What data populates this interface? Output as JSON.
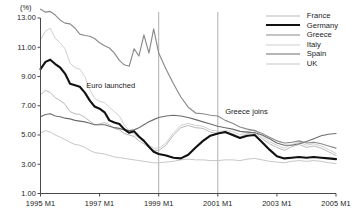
{
  "chart_data": {
    "type": "line",
    "title": "",
    "xlabel": "",
    "ylabel": "(%)",
    "unit_label": "(%)",
    "ylim": [
      1.0,
      13.0
    ],
    "ytick_values": [
      1.0,
      3.0,
      5.0,
      7.0,
      9.0,
      11.0,
      13.0
    ],
    "ytick_labels": [
      "1.00",
      "3.00",
      "5.00",
      "7.00",
      "9.00",
      "11.00",
      "13.00"
    ],
    "xtick_labels": [
      "1995 M1",
      "1997 M1",
      "1999 M1",
      "2001 M1",
      "2003 M1",
      "2005 M1"
    ],
    "xtick_values": [
      1995.0,
      1997.0,
      1999.0,
      2001.0,
      2003.0,
      2005.0
    ],
    "xlim": [
      1995.0,
      2005.0
    ],
    "grid": false,
    "legend_position": "top-right",
    "annotations": [
      {
        "label": "Euro launched",
        "x": 1999.0,
        "text_x": 1996.55,
        "text_y": 8.35
      },
      {
        "label": "Greece joins",
        "x": 2001.0,
        "text_x": 2001.25,
        "text_y": 6.55
      }
    ],
    "series": [
      {
        "name": "France",
        "color": "#b9b9b9",
        "width": 1.0,
        "x": [
          1995.0,
          1995.17,
          1995.33,
          1995.5,
          1995.67,
          1995.83,
          1996.0,
          1996.17,
          1996.33,
          1996.5,
          1996.67,
          1996.83,
          1997.0,
          1997.17,
          1997.33,
          1997.5,
          1997.67,
          1997.83,
          1998.0,
          1998.17,
          1998.33,
          1998.5,
          1998.67,
          1998.83,
          1999.0,
          1999.25,
          1999.5,
          1999.75,
          2000.0,
          2000.25,
          2000.5,
          2000.75,
          2001.0,
          2001.25,
          2001.5,
          2001.75,
          2002.0,
          2002.25,
          2002.5,
          2002.75,
          2003.0,
          2003.25,
          2003.5,
          2003.75,
          2004.0,
          2004.25,
          2004.5,
          2004.75,
          2005.0
        ],
        "values": [
          7.75,
          8.05,
          7.9,
          7.55,
          7.35,
          7.1,
          6.6,
          6.45,
          6.4,
          6.2,
          5.95,
          5.7,
          5.75,
          5.85,
          5.7,
          5.45,
          5.35,
          5.1,
          5.0,
          4.9,
          4.6,
          4.4,
          4.15,
          3.95,
          3.95,
          4.3,
          5.0,
          5.5,
          5.65,
          5.5,
          5.45,
          5.2,
          5.1,
          5.15,
          5.1,
          4.85,
          5.1,
          5.2,
          4.75,
          4.4,
          4.15,
          3.95,
          4.2,
          4.35,
          4.15,
          4.25,
          4.1,
          3.85,
          3.6
        ]
      },
      {
        "name": "Italy",
        "color": "#d0d0d0",
        "width": 1.0,
        "x": [
          1995.0,
          1995.17,
          1995.33,
          1995.5,
          1995.67,
          1995.83,
          1996.0,
          1996.17,
          1996.33,
          1996.5,
          1996.67,
          1996.83,
          1997.0,
          1997.17,
          1997.33,
          1997.5,
          1997.67,
          1997.83,
          1998.0,
          1998.17,
          1998.33,
          1998.5,
          1998.67,
          1998.83,
          1999.0,
          1999.25,
          1999.5,
          1999.75,
          2000.0,
          2000.25,
          2000.5,
          2000.75,
          2001.0,
          2001.25,
          2001.5,
          2001.75,
          2002.0,
          2002.25,
          2002.5,
          2002.75,
          2003.0,
          2003.25,
          2003.5,
          2003.75,
          2004.0,
          2004.25,
          2004.5,
          2004.75,
          2005.0
        ],
        "values": [
          11.5,
          12.1,
          12.3,
          11.6,
          11.3,
          10.9,
          9.9,
          9.6,
          9.5,
          9.0,
          8.1,
          7.5,
          7.3,
          7.2,
          6.9,
          6.6,
          6.3,
          5.7,
          5.3,
          5.05,
          4.8,
          4.55,
          4.3,
          4.1,
          4.1,
          4.45,
          5.15,
          5.65,
          5.8,
          5.65,
          5.6,
          5.35,
          5.25,
          5.3,
          5.25,
          5.0,
          5.25,
          5.35,
          4.9,
          4.55,
          4.3,
          4.1,
          4.35,
          4.5,
          4.3,
          4.4,
          4.25,
          4.0,
          3.75
        ]
      },
      {
        "name": "UK",
        "color": "#c7c7c7",
        "width": 1.0,
        "x": [
          1995.0,
          1995.17,
          1995.33,
          1995.5,
          1995.67,
          1995.83,
          1996.0,
          1996.17,
          1996.33,
          1996.5,
          1996.67,
          1996.83,
          1997.0,
          1997.17,
          1997.33,
          1997.5,
          1997.67,
          1997.83,
          1998.0,
          1998.17,
          1998.33,
          1998.5,
          1998.67,
          1998.83,
          1999.0,
          1999.25,
          1999.5,
          1999.75,
          2000.0,
          2000.25,
          2000.5,
          2000.75,
          2001.0,
          2001.25,
          2001.5,
          2001.75,
          2002.0,
          2002.25,
          2002.5,
          2002.75,
          2003.0,
          2003.25,
          2003.5,
          2003.75,
          2004.0,
          2004.25,
          2004.5,
          2004.75,
          2005.0
        ],
        "values": [
          5.15,
          5.3,
          5.2,
          5.0,
          4.85,
          4.7,
          4.5,
          4.35,
          4.3,
          4.15,
          3.95,
          3.8,
          3.75,
          3.7,
          3.6,
          3.5,
          3.45,
          3.4,
          3.35,
          3.3,
          3.25,
          3.2,
          3.15,
          3.1,
          3.1,
          3.15,
          3.2,
          3.3,
          3.35,
          3.3,
          3.3,
          3.25,
          3.25,
          3.3,
          3.3,
          3.25,
          3.35,
          3.4,
          3.3,
          3.2,
          3.15,
          3.1,
          3.2,
          3.25,
          3.2,
          3.25,
          3.2,
          3.1,
          3.05
        ]
      },
      {
        "name": "Spain",
        "color": "#6d6d6d",
        "width": 1.15,
        "x": [
          1995.0,
          1995.17,
          1995.33,
          1995.5,
          1995.67,
          1995.83,
          1996.0,
          1996.17,
          1996.33,
          1996.5,
          1996.67,
          1996.83,
          1997.0,
          1997.17,
          1997.33,
          1997.5,
          1997.67,
          1997.83,
          1998.0,
          1998.17,
          1998.33,
          1998.5,
          1998.67,
          1998.83,
          1999.0,
          1999.25,
          1999.5,
          1999.75,
          2000.0,
          2000.25,
          2000.5,
          2000.75,
          2001.0,
          2001.25,
          2001.5,
          2001.75,
          2002.0,
          2002.25,
          2002.5,
          2002.75,
          2003.0,
          2003.25,
          2003.5,
          2003.75,
          2004.0,
          2004.25,
          2004.5,
          2004.75,
          2005.0
        ],
        "values": [
          6.25,
          6.4,
          6.45,
          6.3,
          6.25,
          6.15,
          6.1,
          6.0,
          5.95,
          5.9,
          5.8,
          5.7,
          5.7,
          5.7,
          5.6,
          5.5,
          5.45,
          5.35,
          5.3,
          5.35,
          5.5,
          5.7,
          5.9,
          6.05,
          6.2,
          6.3,
          6.35,
          6.3,
          6.2,
          6.05,
          5.9,
          5.75,
          5.6,
          5.5,
          5.4,
          5.25,
          5.2,
          5.15,
          5.0,
          4.75,
          4.45,
          4.3,
          4.3,
          4.4,
          4.55,
          4.75,
          4.95,
          5.05,
          5.1
        ]
      },
      {
        "name": "Greece",
        "color": "#8a8a8a",
        "width": 1.15,
        "x": [
          1995.0,
          1995.17,
          1995.33,
          1995.5,
          1995.67,
          1995.83,
          1996.0,
          1996.17,
          1996.33,
          1996.5,
          1996.67,
          1996.83,
          1997.0,
          1997.17,
          1997.33,
          1997.5,
          1997.67,
          1997.83,
          1998.0,
          1998.17,
          1998.33,
          1998.5,
          1998.67,
          1998.83,
          1999.0,
          1999.25,
          1999.5,
          1999.75,
          2000.0,
          2000.25,
          2000.5,
          2000.75,
          2001.0,
          2001.25,
          2001.5,
          2001.75,
          2002.0,
          2002.25,
          2002.5,
          2002.75,
          2003.0,
          2003.25,
          2003.5,
          2003.75,
          2004.0,
          2004.25,
          2004.5,
          2004.75,
          2005.0
        ],
        "values": [
          13.6,
          13.4,
          13.45,
          13.2,
          12.85,
          12.65,
          12.6,
          12.3,
          11.9,
          11.8,
          11.75,
          11.6,
          11.3,
          11.1,
          10.95,
          10.6,
          10.1,
          9.8,
          9.7,
          10.9,
          10.4,
          11.85,
          10.6,
          12.25,
          10.6,
          9.5,
          8.5,
          7.6,
          6.9,
          6.5,
          6.45,
          6.35,
          6.3,
          6.0,
          5.8,
          5.55,
          5.4,
          5.3,
          5.1,
          4.85,
          4.6,
          4.45,
          4.5,
          4.6,
          4.45,
          4.5,
          4.4,
          4.25,
          4.1
        ]
      },
      {
        "name": "Germany",
        "color": "#111111",
        "width": 2.1,
        "x": [
          1995.0,
          1995.17,
          1995.33,
          1995.5,
          1995.67,
          1995.83,
          1996.0,
          1996.17,
          1996.33,
          1996.5,
          1996.67,
          1996.83,
          1997.0,
          1997.17,
          1997.33,
          1997.5,
          1997.67,
          1997.83,
          1998.0,
          1998.17,
          1998.33,
          1998.5,
          1998.67,
          1998.83,
          1999.0,
          1999.25,
          1999.5,
          1999.75,
          2000.0,
          2000.25,
          2000.5,
          2000.75,
          2001.0,
          2001.25,
          2001.5,
          2001.75,
          2002.0,
          2002.25,
          2002.5,
          2002.75,
          2003.0,
          2003.25,
          2003.5,
          2003.75,
          2004.0,
          2004.25,
          2004.5,
          2004.75,
          2005.0
        ],
        "values": [
          9.5,
          10.0,
          10.15,
          9.85,
          9.6,
          9.2,
          8.5,
          8.4,
          8.3,
          7.9,
          7.35,
          6.95,
          6.8,
          6.55,
          6.0,
          5.85,
          5.75,
          5.4,
          5.15,
          5.25,
          4.9,
          4.6,
          4.2,
          3.85,
          3.7,
          3.6,
          3.45,
          3.4,
          3.65,
          4.15,
          4.6,
          4.95,
          5.1,
          5.2,
          5.0,
          4.8,
          4.95,
          5.0,
          4.5,
          4.0,
          3.55,
          3.4,
          3.45,
          3.5,
          3.45,
          3.5,
          3.45,
          3.4,
          3.35
        ]
      }
    ]
  },
  "legend": {
    "items": [
      {
        "label": "France",
        "color": "#b9b9b9",
        "width": 1.0
      },
      {
        "label": "Germany",
        "color": "#111111",
        "width": 2.2
      },
      {
        "label": "Greece",
        "color": "#8a8a8a",
        "width": 1.2
      },
      {
        "label": "Italy",
        "color": "#d0d0d0",
        "width": 1.0
      },
      {
        "label": "Spain",
        "color": "#6d6d6d",
        "width": 1.2
      },
      {
        "label": "UK",
        "color": "#c7c7c7",
        "width": 1.0
      }
    ]
  }
}
